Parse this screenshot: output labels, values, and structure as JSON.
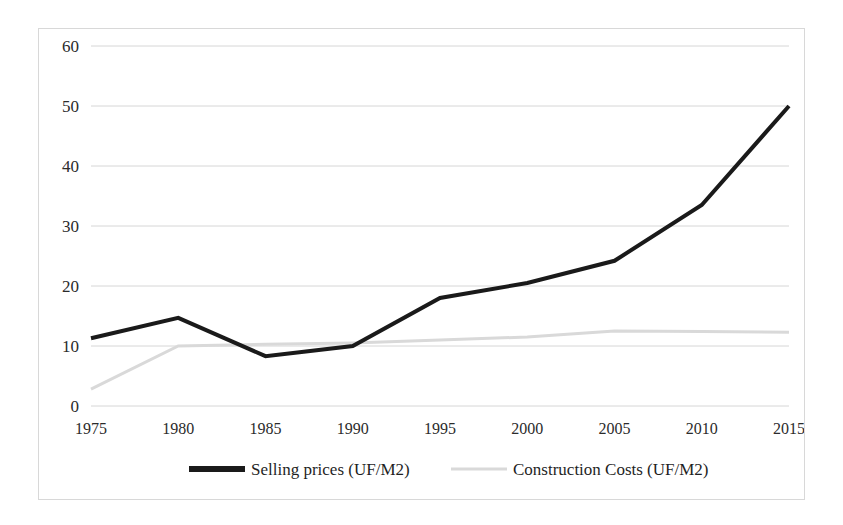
{
  "chart_data": {
    "type": "line",
    "title": "",
    "subtitle": "",
    "xlabel": "",
    "ylabel": "",
    "x": [
      1975,
      1980,
      1985,
      1990,
      1995,
      2000,
      2005,
      2010,
      2015
    ],
    "categories": [
      "1975",
      "1980",
      "1985",
      "1990",
      "1995",
      "2000",
      "2005",
      "2010",
      "2015"
    ],
    "xlim": [
      1975,
      2015
    ],
    "ylim": [
      0,
      60
    ],
    "yticks": [
      0,
      10,
      20,
      30,
      40,
      50,
      60
    ],
    "ytick_labels": [
      "0",
      "10",
      "20",
      "30",
      "40",
      "50",
      "60"
    ],
    "xtick_labels": [
      "1975",
      "1980",
      "1985",
      "1990",
      "1995",
      "2000",
      "2005",
      "2010",
      "2015"
    ],
    "grid": "horizontal",
    "legend_position": "bottom",
    "series": [
      {
        "name": "Selling prices (UF/M2)",
        "color": "#1a1a1a",
        "line_width": 4,
        "values": [
          11.3,
          14.7,
          8.3,
          10.0,
          18.0,
          20.5,
          24.2,
          33.5,
          50.0
        ]
      },
      {
        "name": "Construction Costs (UF/M2)",
        "color": "#d9d9d9",
        "line_width": 3,
        "values": [
          2.8,
          10.0,
          10.3,
          10.5,
          11.0,
          11.5,
          12.5,
          12.4,
          12.3
        ]
      }
    ]
  },
  "legend": {
    "entries": [
      {
        "label": "Selling prices (UF/M2)",
        "color": "#1a1a1a"
      },
      {
        "label": "Construction Costs (UF/M2)",
        "color": "#d9d9d9"
      }
    ]
  },
  "frame": {
    "border_color": "#d8d8d8",
    "background": "#ffffff"
  }
}
